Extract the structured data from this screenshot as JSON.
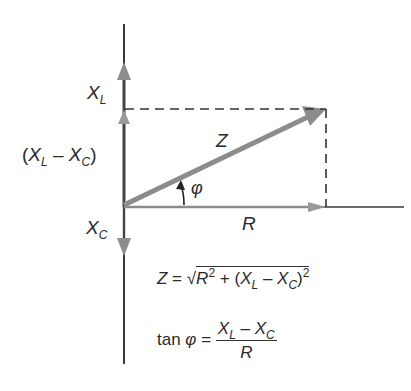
{
  "diagram": {
    "type": "phasor-diagram",
    "colors": {
      "axis": "#3a3a3a",
      "vector": "#8c8c8c",
      "dashed": "#333333",
      "text": "#2a2a2a"
    },
    "labels": {
      "xl": {
        "main": "X",
        "sub": "L"
      },
      "xl_minus_xc": {
        "open": "(",
        "a": "X",
        "a_sub": "L",
        "minus": " – ",
        "b": "X",
        "b_sub": "C",
        "close": ")"
      },
      "xc": {
        "main": "X",
        "sub": "C"
      },
      "z": "Z",
      "r": "R",
      "phi": "φ"
    },
    "equations": {
      "impedance": {
        "lhs": "Z",
        "eq": " = ",
        "root": "√",
        "r": "R",
        "r_exp": "2",
        "plus": " + (",
        "xl": "X",
        "xl_sub": "L",
        "minus": " – ",
        "xc": "X",
        "xc_sub": "C",
        "close": ")",
        "close_exp": "2"
      },
      "phase": {
        "lhs_fn": "tan ",
        "lhs_var": "φ",
        "eq": " = ",
        "num_a": "X",
        "num_a_sub": "L",
        "num_minus": " – ",
        "num_b": "X",
        "num_b_sub": "C",
        "den": "R"
      }
    }
  }
}
